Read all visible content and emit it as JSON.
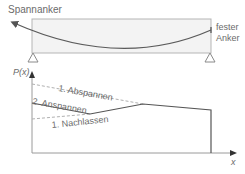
{
  "beam": {
    "tendon_anchor_left_label": "Spannanker",
    "tendon_anchor_right_label_line1": "fester",
    "tendon_anchor_right_label_line2": "Anker"
  },
  "graph": {
    "y_axis_label": "P(x)",
    "x_axis_label": "x",
    "curves": [
      {
        "name": "1. Abspannen",
        "style": "dashed"
      },
      {
        "name": "2. Anspannen",
        "style": "solid"
      },
      {
        "name": "1. Nachlassen",
        "style": "dashed"
      }
    ]
  },
  "colors": {
    "beam_fill": "#f3f3f3",
    "beam_stroke": "#b5b5b5",
    "tendon": "#5a5a5a",
    "axis": "#9a9a9a",
    "solid_curve": "#555555",
    "dashed_curve": "#b0b0b0",
    "text": "#6b6b6b"
  }
}
